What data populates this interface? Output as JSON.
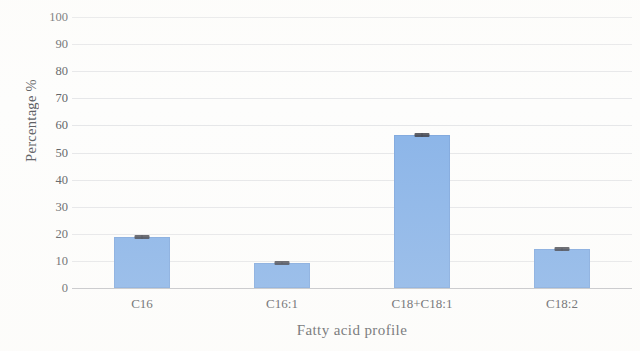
{
  "chart_data": {
    "type": "bar",
    "title": "",
    "xlabel": "Fatty acid profile",
    "ylabel": "Percentage %",
    "categories": [
      "C16",
      "C16:1",
      "C18+C18:1",
      "C18:2"
    ],
    "values": [
      18.8,
      9.2,
      56.5,
      14.3
    ],
    "errors": [
      0.6,
      0.4,
      0.7,
      0.5
    ],
    "ylim": [
      0,
      100
    ],
    "ytick_labels": [
      "0",
      "10",
      "20",
      "30",
      "40",
      "50",
      "60",
      "70",
      "80",
      "90",
      "100"
    ],
    "ytick_values": [
      0,
      10,
      20,
      30,
      40,
      50,
      60,
      70,
      80,
      90,
      100
    ],
    "grid": true,
    "legend": false,
    "bar_color": "#8ab4e8",
    "errorbar_color": "#3e4048",
    "gridline_color": "#d9dadd",
    "axis_text_color": "#45474b",
    "background_color": "#fdfdfc"
  }
}
